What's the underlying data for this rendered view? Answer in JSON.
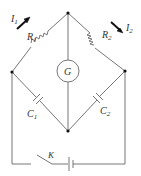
{
  "diagram": {
    "type": "wheatstone-bridge-circuit",
    "components": {
      "R1": {
        "letter": "R",
        "sub": "1"
      },
      "R2": {
        "letter": "R",
        "sub": "2"
      },
      "C1": {
        "letter": "C",
        "sub": "1"
      },
      "C2": {
        "letter": "C",
        "sub": "2"
      },
      "G": {
        "letter": "G"
      },
      "K": {
        "letter": "K"
      },
      "I1": {
        "letter": "I",
        "sub": "1"
      },
      "I2": {
        "letter": "I",
        "sub": "2"
      }
    },
    "colors": {
      "line": "#555555",
      "node": "#111111"
    }
  }
}
